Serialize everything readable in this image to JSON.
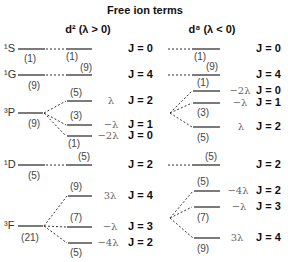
{
  "title": "Free ion terms",
  "columns": {
    "left": {
      "header": "d² (λ > 0)"
    },
    "right": {
      "header": "d⁸ (λ < 0)"
    }
  },
  "terms": [
    {
      "label": "¹S",
      "degeneracy": "(1)"
    },
    {
      "label": "¹G",
      "degeneracy": "(9)"
    },
    {
      "label": "³P",
      "degeneracy": "(9)"
    },
    {
      "label": "¹D",
      "degeneracy": "(5)"
    },
    {
      "label": "³F",
      "degeneracy": "(21)"
    }
  ],
  "left_levels": [
    {
      "deg": "(1)",
      "energy": "",
      "J": "J = 0"
    },
    {
      "deg": "(9)",
      "energy": "",
      "J": "J = 4"
    },
    {
      "deg": "(5)",
      "energy": "λ",
      "J": "J = 2"
    },
    {
      "deg": "(3)",
      "energy": "−λ",
      "J": "J = 1"
    },
    {
      "deg": "(1)",
      "energy": "−2λ",
      "J": "J = 0"
    },
    {
      "deg": "(5)",
      "energy": "",
      "J": "J = 2"
    },
    {
      "deg": "(9)",
      "energy": "3λ",
      "J": "J = 4"
    },
    {
      "deg": "(7)",
      "energy": "−λ",
      "J": "J = 3"
    },
    {
      "deg": "(5)",
      "energy": "−4λ",
      "J": "J = 2"
    }
  ],
  "right_levels": [
    {
      "deg": "(1)",
      "energy": "",
      "J": "J = 0"
    },
    {
      "deg": "(9)",
      "energy": "",
      "J": "J = 4"
    },
    {
      "deg": "(1)",
      "energy": "−2λ",
      "J": "J = 0"
    },
    {
      "deg": "(3)",
      "energy": "−λ",
      "J": "J = 1"
    },
    {
      "deg": "(5)",
      "energy": "λ",
      "J": "J = 2"
    },
    {
      "deg": "(5)",
      "energy": "",
      "J": "J = 2"
    },
    {
      "deg": "(5)",
      "energy": "−4λ",
      "J": "J = 2"
    },
    {
      "deg": "(7)",
      "energy": "−λ",
      "J": "J = 3"
    },
    {
      "deg": "(9)",
      "energy": "3λ",
      "J": "J = 4"
    }
  ]
}
